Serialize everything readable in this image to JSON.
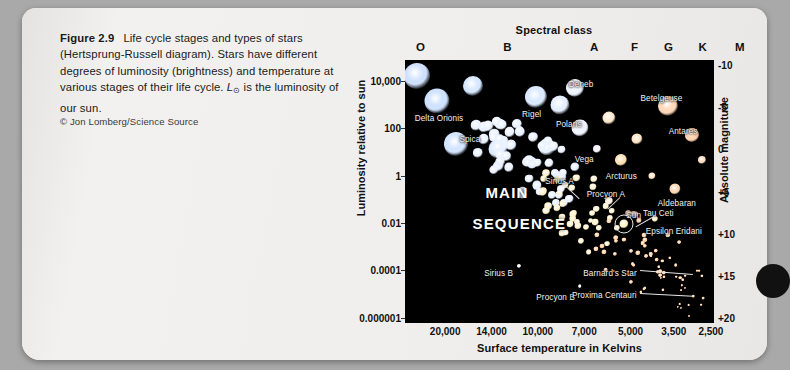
{
  "figure": {
    "number": "Figure 2.9",
    "caption_part1": "Life cycle stages and types of stars (Hertsprung-Russell diagram). Stars have different degrees of luminosity (brightness) and temperature at various stages of their life cycle. ",
    "caption_symbol": "L",
    "caption_symbol_sub": "⊙",
    "caption_part2": " is the luminosity of our sun.",
    "credit": "© Jon Lomberg/Science Source"
  },
  "chart_data": {
    "type": "scatter",
    "title": "Spectral class",
    "xlabel": "Surface temperature in Kelvins",
    "ylabel": "Luminosity relative to sun",
    "y2label": "Absolute magnitude",
    "grid": false,
    "legend": null,
    "top_axis": {
      "label": "Spectral class",
      "ticks": [
        "O",
        "B",
        "A",
        "F",
        "G",
        "K",
        "M"
      ],
      "tick_pos_pct": [
        5,
        33,
        61,
        74,
        85,
        96,
        108
      ]
    },
    "x_axis": {
      "label": "Surface temperature in Kelvins",
      "ticks": [
        "20,000",
        "14,000",
        "10,000",
        "7,000",
        "5,000",
        "3,500",
        "2,500"
      ],
      "tick_pos_pct": [
        13,
        28,
        43,
        58,
        73,
        87,
        99
      ],
      "direction": "decreasing"
    },
    "y_axis_left": {
      "label": "Luminosity relative to sun",
      "ticks": [
        "10,000",
        "100",
        "1",
        "0.01",
        "0.0001",
        "0.000001"
      ],
      "tick_pos_pct": [
        8,
        26,
        44,
        62,
        80,
        98
      ],
      "scale": "log"
    },
    "y_axis_right": {
      "label": "Absolute magnitude",
      "ticks": [
        "-10",
        "-5",
        "0",
        "+5",
        "+10",
        "+15",
        "+20"
      ],
      "tick_pos_pct": [
        2,
        18,
        34,
        50,
        66,
        82,
        98
      ]
    },
    "region_labels": [
      {
        "text": "MAIN",
        "x_pct": 33,
        "y_pct": 50
      },
      {
        "text": "SEQUENCE",
        "x_pct": 37,
        "y_pct": 62
      }
    ],
    "points": [
      {
        "name": "Delta Orionis",
        "x_pct": 10.5,
        "y_pct": 15.5,
        "size": 22,
        "color": "#cfe2ff",
        "label_x_pct": 11,
        "label_y_pct": 20.5,
        "label_align": "center"
      },
      {
        "name": "Spica",
        "x_pct": 16.5,
        "y_pct": 32.0,
        "size": 21,
        "color": "#d4e6ff",
        "label_x_pct": 21,
        "label_y_pct": 28.5,
        "label_align": "center"
      },
      {
        "name": "Rigel",
        "x_pct": 42.5,
        "y_pct": 14.0,
        "size": 19,
        "color": "#dbeaff",
        "label_x_pct": 41,
        "label_y_pct": 19.0,
        "label_align": "center"
      },
      {
        "name": "Deneb",
        "x_pct": 55.0,
        "y_pct": 10.5,
        "size": 17,
        "color": "#eef4ff",
        "label_x_pct": 57,
        "label_y_pct": 7.5,
        "label_align": "center"
      },
      {
        "name": "Polaris",
        "x_pct": 56.5,
        "y_pct": 26.0,
        "size": 16,
        "color": "#f0f4ff",
        "label_x_pct": 53,
        "label_y_pct": 23.0,
        "label_align": "center"
      },
      {
        "name": "Betelgeuse",
        "x_pct": 85.0,
        "y_pct": 17.5,
        "size": 18,
        "color": "#ffd9bb",
        "label_x_pct": 83,
        "label_y_pct": 13.0,
        "label_align": "center"
      },
      {
        "name": "Antares",
        "x_pct": 93.0,
        "y_pct": 28.5,
        "size": 14,
        "color": "#ffd2b2",
        "label_x_pct": 90,
        "label_y_pct": 25.5,
        "label_align": "center"
      },
      {
        "name": "Vega",
        "x_pct": 55.0,
        "y_pct": 40.5,
        "size": 9,
        "color": "#e7f0ff",
        "label_x_pct": 58,
        "label_y_pct": 36.0,
        "label_align": "center"
      },
      {
        "name": "Arcturus",
        "x_pct": 70.0,
        "y_pct": 38.0,
        "size": 11,
        "color": "#ffe2b8",
        "label_x_pct": 70,
        "label_y_pct": 42.5,
        "label_align": "center"
      },
      {
        "name": "Sirius A",
        "x_pct": 50.5,
        "y_pct": 49.0,
        "size": 8,
        "color": "#f2f6ff",
        "label_x_pct": 50,
        "label_y_pct": 44.5,
        "label_align": "center"
      },
      {
        "name": "Procyon A",
        "x_pct": 66.0,
        "y_pct": 53.5,
        "size": 8,
        "color": "#fff3dd",
        "label_x_pct": 65,
        "label_y_pct": 49.5,
        "label_align": "center"
      },
      {
        "name": "Aldebaran",
        "x_pct": 87.5,
        "y_pct": 49.0,
        "size": 10,
        "color": "#ffd9b5",
        "label_x_pct": 88,
        "label_y_pct": 53.0,
        "label_align": "center"
      },
      {
        "name": "Sun",
        "x_pct": 71.0,
        "y_pct": 62.5,
        "size": 9,
        "color": "#fff5cc",
        "label_x_pct": 74,
        "label_y_pct": 57.5,
        "label_align": "center"
      },
      {
        "name": "Tau Ceti",
        "x_pct": 81.0,
        "y_pct": 60.5,
        "size": 6,
        "color": "#ffeec4",
        "label_x_pct": 82,
        "label_y_pct": 56.5,
        "label_align": "center"
      },
      {
        "name": "Epsilon Eridani",
        "x_pct": 85.0,
        "y_pct": 66.5,
        "size": 5,
        "color": "#ffe0b8",
        "label_x_pct": 87,
        "label_y_pct": 63.5,
        "label_align": "center"
      },
      {
        "name": "Sirius B",
        "x_pct": 37.0,
        "y_pct": 78.5,
        "size": 4,
        "color": "#ffffff",
        "label_x_pct": 35,
        "label_y_pct": 79.5,
        "label_align": "right"
      },
      {
        "name": "Procyon B",
        "x_pct": 56.5,
        "y_pct": 86.0,
        "size": 3.5,
        "color": "#ffffff",
        "label_x_pct": 55,
        "label_y_pct": 88.5,
        "label_align": "right"
      },
      {
        "name": "Barnard's Star",
        "x_pct": 96.0,
        "y_pct": 82.0,
        "size": 3,
        "color": "#ffd2a8",
        "label_x_pct": 75,
        "label_y_pct": 79.5,
        "label_align": "right"
      },
      {
        "name": "Proxima Centauri",
        "x_pct": 96.5,
        "y_pct": 90.5,
        "size": 2.5,
        "color": "#ffcda0",
        "label_x_pct": 75,
        "label_y_pct": 88.0,
        "label_align": "right"
      }
    ]
  }
}
